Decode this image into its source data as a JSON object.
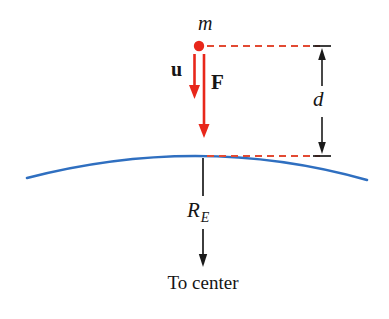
{
  "figure": {
    "background_color": "#ffffff",
    "colors": {
      "red": "#e8271b",
      "dashed_red": "#e24a33",
      "blue": "#2f6fc0",
      "black": "#1a1a1a"
    },
    "labels": {
      "mass": "m",
      "initial_velocity": "u",
      "force": "F",
      "distance": "d",
      "earth_radius_symbol": "R",
      "earth_radius_subscript": "E",
      "caption": "To center"
    }
  }
}
